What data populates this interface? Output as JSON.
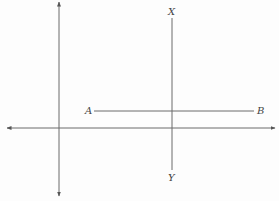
{
  "diagram": {
    "type": "geometry",
    "colors": {
      "line": "#6a6a6a",
      "label": "#444444",
      "background": "#fdfdfd"
    },
    "labels": {
      "a": "A",
      "b": "B",
      "x": "X",
      "y": "Y"
    },
    "axes": {
      "vertical": {
        "x": 59,
        "y1": 2,
        "y2": 196,
        "arrows": "both"
      },
      "horizontal": {
        "y": 128,
        "x1": 7,
        "x2": 275,
        "arrows": "both"
      }
    },
    "segments": {
      "ab": {
        "x1": 94,
        "y1": 111,
        "x2": 254,
        "y2": 111
      },
      "xy": {
        "x1": 172,
        "y1": 18,
        "x2": 172,
        "y2": 170
      }
    }
  }
}
